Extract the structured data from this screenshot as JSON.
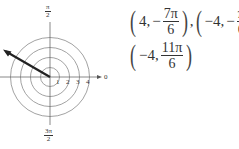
{
  "figure": {
    "type": "polar-grid",
    "center": [
      50,
      77
    ],
    "ring_spacing_px": 10,
    "rings": [
      1,
      2,
      3,
      4
    ],
    "ring_labels": [
      "1",
      "2",
      "3",
      "4"
    ],
    "axis_labels": {
      "right": "0",
      "top": {
        "num": "π",
        "den": "2"
      },
      "bottom": {
        "num": "3π",
        "den": "2"
      }
    },
    "arrow": {
      "angle_deg": 150,
      "length": 5.0
    },
    "colors": {
      "grid": "#888888",
      "axis": "#666666",
      "arrow": "#222222"
    }
  },
  "answer": {
    "points": [
      {
        "r": "4,",
        "sign": "−",
        "num": "7π",
        "den": "6",
        "sep": ","
      },
      {
        "r": "−4,",
        "sign": "−",
        "num": "π",
        "den": "6",
        "sep": ","
      },
      {
        "r": "−4,",
        "sign": "",
        "num": "11π",
        "den": "6",
        "sep": ""
      }
    ]
  }
}
